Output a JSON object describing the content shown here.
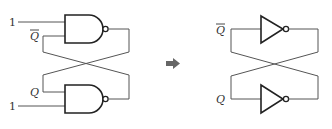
{
  "diagram": {
    "left_circuit": {
      "name": "Cross-coupled NAND latch",
      "top_gate": {
        "type": "NAND",
        "input_constant": "1",
        "feedback_label": "Q",
        "feedback_label_overline": true
      },
      "bottom_gate": {
        "type": "NAND",
        "input_constant": "1",
        "feedback_label": "Q",
        "feedback_label_overline": false
      }
    },
    "transform_arrow": {
      "icon": "right-arrow-icon",
      "meaning": "equivalent to"
    },
    "right_circuit": {
      "name": "Cross-coupled inverter pair",
      "top_gate": {
        "type": "NOT",
        "input_label": "Q",
        "input_label_overline": true
      },
      "bottom_gate": {
        "type": "NOT",
        "input_label": "Q",
        "input_label_overline": false
      }
    },
    "colors": {
      "gate_stroke": "#222222",
      "wire": "#555555",
      "arrow": "#666666",
      "background": "#ffffff"
    }
  }
}
